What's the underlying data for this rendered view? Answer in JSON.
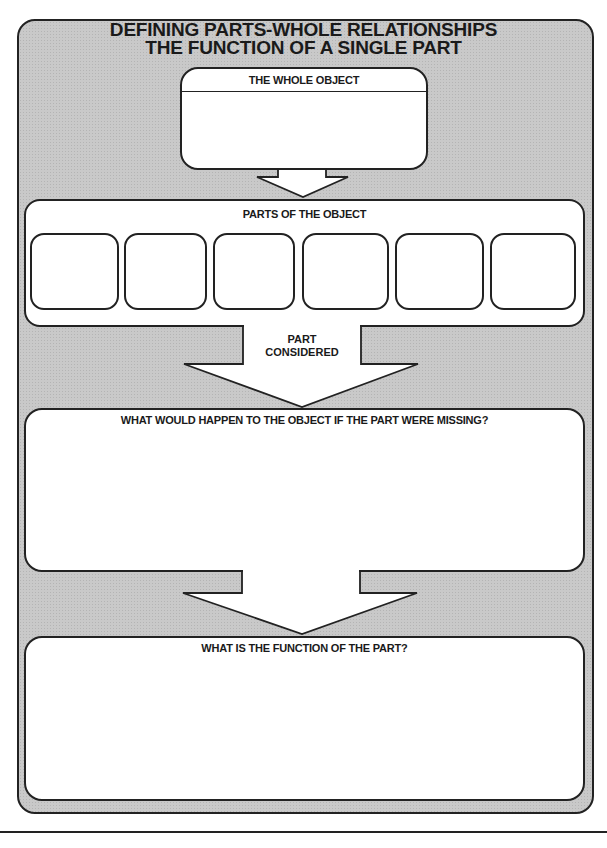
{
  "title": {
    "line1": "DEFINING PARTS-WHOLE RELATIONSHIPS",
    "line2": "THE FUNCTION OF A SINGLE PART"
  },
  "whole_object": {
    "label": "THE WHOLE OBJECT",
    "value": ""
  },
  "parts": {
    "label": "PARTS OF THE OBJECT",
    "slots": [
      "",
      "",
      "",
      "",
      "",
      ""
    ]
  },
  "part_considered": {
    "line1": "PART",
    "line2": "CONSIDERED",
    "value": ""
  },
  "missing": {
    "label": "WHAT WOULD HAPPEN TO THE OBJECT IF THE PART WERE MISSING?",
    "value": ""
  },
  "function": {
    "label": "WHAT IS THE FUNCTION OF THE PART?",
    "value": ""
  },
  "colors": {
    "frame_fill": "#c9c9c9",
    "stroke": "#222222",
    "box_fill": "#ffffff"
  }
}
